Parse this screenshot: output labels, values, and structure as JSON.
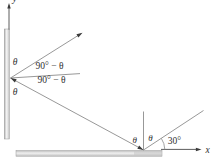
{
  "diagram": {
    "axis_labels": {
      "y": "y",
      "x": "x"
    },
    "vertical_mirror": {
      "angle_above": "θ",
      "angle_below": "θ"
    },
    "reference_line_angles": {
      "above": "90° − θ",
      "below": "90° − θ"
    },
    "horizontal_mirror": {
      "angle_left": "θ",
      "angle_right": "θ",
      "incident_angle": "30°"
    },
    "colors": {
      "ray": "#8c8c8c",
      "axis": "#4a4a4a",
      "arrowhead": "#3a3a3a",
      "mirror_edge": "#9a9a9a",
      "mirror_light": "#f2f2f2",
      "mirror_dark": "#b0b0b0",
      "text": "#2f2f2f",
      "background": "#ffffff"
    }
  }
}
